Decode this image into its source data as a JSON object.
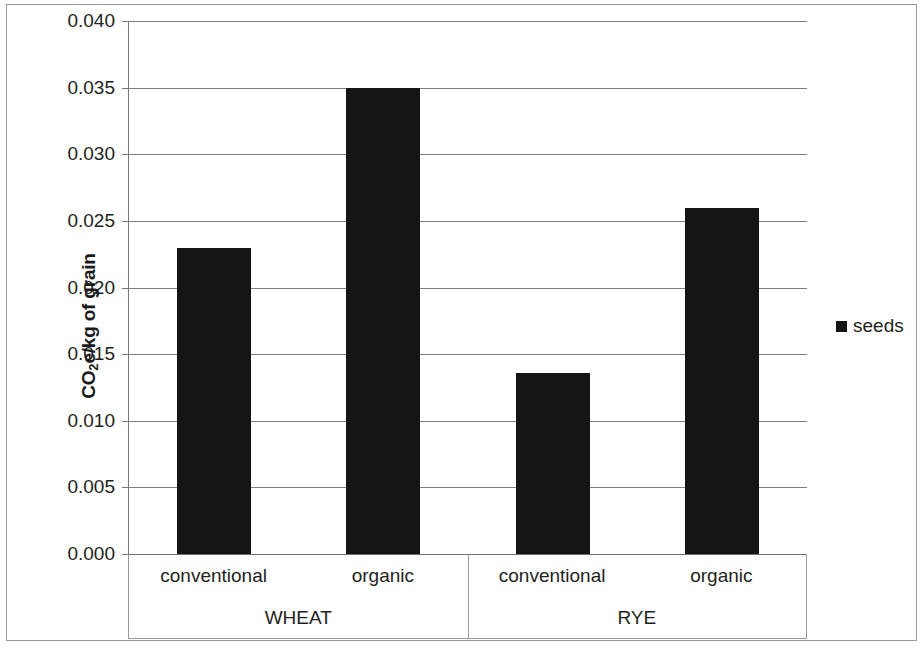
{
  "chart_data": {
    "type": "bar",
    "title": "",
    "xlabel": "",
    "ylabel": "CO2e/kg of grain",
    "ylabel_parts": {
      "pre": "CO",
      "sub": "2",
      "post": "e/kg of grain"
    },
    "ylim": [
      0.0,
      0.04
    ],
    "ytick_labels": [
      "0.040",
      "0.035",
      "0.030",
      "0.025",
      "0.020",
      "0.015",
      "0.010",
      "0.005",
      "0.000"
    ],
    "ytick_values": [
      0.04,
      0.035,
      0.03,
      0.025,
      0.02,
      0.015,
      0.01,
      0.005,
      0.0
    ],
    "grid": true,
    "legend_position": "right",
    "series": [
      {
        "name": "seeds",
        "color": "#141414",
        "values": [
          0.023,
          0.035,
          0.0136,
          0.026
        ]
      }
    ],
    "categories": [
      "conventional",
      "organic",
      "conventional",
      "organic"
    ],
    "groups": [
      {
        "label": "WHEAT",
        "categories": [
          "conventional",
          "organic"
        ],
        "values": [
          0.023,
          0.035
        ]
      },
      {
        "label": "RYE",
        "categories": [
          "conventional",
          "organic"
        ],
        "values": [
          0.0136,
          0.026
        ]
      }
    ]
  },
  "legend": {
    "entries": [
      {
        "label": "seeds",
        "color": "#141414"
      }
    ]
  },
  "axis": {
    "y_title": "CO2e/kg of grain",
    "ticks": [
      "0.040",
      "0.035",
      "0.030",
      "0.025",
      "0.020",
      "0.015",
      "0.010",
      "0.005",
      "0.000"
    ]
  },
  "category_axis": {
    "tier1": [
      "conventional",
      "organic",
      "conventional",
      "organic"
    ],
    "tier2": [
      "WHEAT",
      "RYE"
    ]
  },
  "colors": {
    "bar": "#141414",
    "gridline": "#7f7f7f",
    "frame": "#9a9a9a",
    "text": "#231f20"
  }
}
